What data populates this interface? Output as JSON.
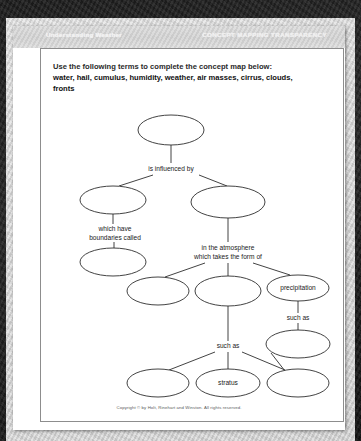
{
  "banner": {
    "left_title": "Understanding Weather",
    "right_title": "CONCEPT MAPPING TRANSPARENCY"
  },
  "instructions": {
    "directive": "Use the following terms to complete the concept map below:",
    "word_bank": "water, hail, cumulus, humidity, weather, air masses, cirrus, clouds, fronts"
  },
  "footer": {
    "copyright": "Copyright © by Holt, Rinehart and Winston. All rights reserved."
  },
  "concept_map": {
    "nodes": [
      {
        "id": "n-top",
        "label": "",
        "cx": 158,
        "cy": 104,
        "rx": 33,
        "ry": 15
      },
      {
        "id": "n-left-1",
        "label": "",
        "cx": 100,
        "cy": 174,
        "rx": 33,
        "ry": 14
      },
      {
        "id": "n-right-1",
        "label": "",
        "cx": 215,
        "cy": 176,
        "rx": 37,
        "ry": 16
      },
      {
        "id": "n-left-2",
        "label": "",
        "cx": 100,
        "cy": 236,
        "rx": 33,
        "ry": 14
      },
      {
        "id": "n-mid-left",
        "label": "",
        "cx": 145,
        "cy": 265,
        "rx": 31,
        "ry": 14
      },
      {
        "id": "n-mid-center",
        "label": "",
        "cx": 215,
        "cy": 265,
        "rx": 33,
        "ry": 15
      },
      {
        "id": "n-precipitation",
        "label": "precipitation",
        "cx": 285,
        "cy": 262,
        "rx": 31,
        "ry": 13
      },
      {
        "id": "n-right-2",
        "label": "",
        "cx": 285,
        "cy": 318,
        "rx": 32,
        "ry": 14
      },
      {
        "id": "n-bottom-left",
        "label": "",
        "cx": 145,
        "cy": 357,
        "rx": 31,
        "ry": 14
      },
      {
        "id": "n-bottom-mid",
        "label": "stratus",
        "cx": 215,
        "cy": 357,
        "rx": 32,
        "ry": 14
      },
      {
        "id": "n-bottom-right",
        "label": "",
        "cx": 285,
        "cy": 357,
        "rx": 31,
        "ry": 14
      }
    ],
    "link_labels": [
      {
        "id": "lbl-influenced",
        "text": "is influenced by",
        "x": 158,
        "y": 143
      },
      {
        "id": "lbl-boundaries-1",
        "text": "which have",
        "x": 102,
        "y": 203
      },
      {
        "id": "lbl-boundaries-2",
        "text": "boundaries called",
        "x": 102,
        "y": 212
      },
      {
        "id": "lbl-atmos-1",
        "text": "in the atmosphere",
        "x": 215,
        "y": 222
      },
      {
        "id": "lbl-atmos-2",
        "text": "which takes the form of",
        "x": 215,
        "y": 231
      },
      {
        "id": "lbl-suchas-mid",
        "text": "such as",
        "x": 215,
        "y": 320
      },
      {
        "id": "lbl-suchas-right",
        "text": "such as",
        "x": 285,
        "y": 292
      }
    ],
    "edges": [
      {
        "id": "e-top-down",
        "d": "M 158 119 L 158 137"
      },
      {
        "id": "e-fork-left",
        "d": "M 140 149 L 106 160"
      },
      {
        "id": "e-fork-right",
        "d": "M 186 149 L 214 160"
      },
      {
        "id": "e-left1-down",
        "d": "M 100 188 L 100 198"
      },
      {
        "id": "e-left-boundaries",
        "d": "M 101 216 L 101 222"
      },
      {
        "id": "e-right1-down",
        "d": "M 215 192 L 215 216"
      },
      {
        "id": "e-atmos-left",
        "d": "M 192 237 L 152 251"
      },
      {
        "id": "e-atmos-mid",
        "d": "M 215 237 L 215 250"
      },
      {
        "id": "e-atmos-right",
        "d": "M 240 237 L 277 249"
      },
      {
        "id": "e-precip-down",
        "d": "M 285 275 L 285 287"
      },
      {
        "id": "e-precip-suchas",
        "d": "M 285 297 L 285 304"
      },
      {
        "id": "e-mid-down",
        "d": "M 215 280 L 215 315"
      },
      {
        "id": "e-suchas-left",
        "d": "M 202 326 L 156 344"
      },
      {
        "id": "e-suchas-mid",
        "d": "M 215 326 L 215 343"
      },
      {
        "id": "e-suchas-right",
        "d": "M 229 326 L 272 344"
      },
      {
        "id": "e-right2-bottom",
        "d": "M 258 327 L 272 345"
      }
    ]
  }
}
